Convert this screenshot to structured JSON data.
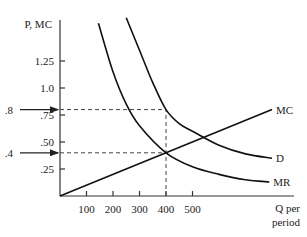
{
  "chart_data": {
    "type": "line",
    "title": "",
    "ylabel": "P, MC",
    "xlabel": "Q per period",
    "xlabel_lines": [
      "Q per",
      "period"
    ],
    "xlim": [
      0,
      900
    ],
    "ylim": [
      0,
      1.6
    ],
    "grid": false,
    "x_ticks": [
      {
        "value": 100,
        "label": "100"
      },
      {
        "value": 200,
        "label": "200"
      },
      {
        "value": 300,
        "label": "300"
      },
      {
        "value": 400,
        "label": "400"
      },
      {
        "value": 500,
        "label": "500"
      }
    ],
    "y_ticks": [
      {
        "value": 0.25,
        "label": ".25"
      },
      {
        "value": 0.5,
        "label": ".50"
      },
      {
        "value": 0.75,
        "label": ".75"
      },
      {
        "value": 1.0,
        "label": "1.0"
      },
      {
        "value": 1.25,
        "label": "1.25"
      }
    ],
    "series": [
      {
        "name": "MR",
        "label": "MR",
        "points": [
          [
            145,
            1.6
          ],
          [
            200,
            1.15
          ],
          [
            250,
            0.85
          ],
          [
            300,
            0.65
          ],
          [
            400,
            0.4
          ],
          [
            500,
            0.27
          ],
          [
            600,
            0.2
          ],
          [
            700,
            0.15
          ],
          [
            790,
            0.13
          ]
        ]
      },
      {
        "name": "D",
        "label": "D",
        "points": [
          [
            250,
            1.65
          ],
          [
            300,
            1.35
          ],
          [
            350,
            1.05
          ],
          [
            400,
            0.8
          ],
          [
            450,
            0.67
          ],
          [
            500,
            0.6
          ],
          [
            600,
            0.47
          ],
          [
            700,
            0.39
          ],
          [
            800,
            0.35
          ]
        ]
      },
      {
        "name": "MC",
        "label": "MC",
        "points": [
          [
            0,
            0
          ],
          [
            400,
            0.4
          ],
          [
            800,
            0.8
          ]
        ]
      }
    ],
    "annotations": [
      {
        "label": ".8",
        "y": 0.8,
        "arrow": "to-axis",
        "dashed_to_x": 400
      },
      {
        "label": ".4",
        "y": 0.4,
        "arrow": "to-axis",
        "dashed_to_x": 400
      },
      {
        "type": "vline",
        "x": 400,
        "from_y": 0,
        "to_y": 0.8,
        "dashed": true
      }
    ]
  }
}
